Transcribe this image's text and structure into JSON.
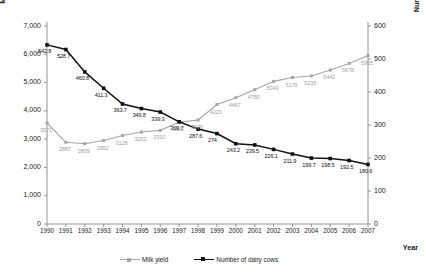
{
  "chart_data": {
    "type": "line",
    "title": "",
    "xlabel": "Year",
    "ylabel": "Milk (kg milk/milking cow/year)",
    "ylabel_right": "Number of dairy cows (ths.heads)",
    "categories": [
      "1990",
      "1991",
      "1992",
      "1993",
      "1994",
      "1995",
      "1996",
      "1997",
      "1998",
      "1999",
      "2000",
      "2001",
      "2002",
      "2003",
      "2004",
      "2005",
      "2006",
      "2007"
    ],
    "ylim": [
      0,
      7000
    ],
    "ylim_right": [
      0,
      600
    ],
    "yticks": [
      "0",
      "1,000",
      "2,000",
      "3,000",
      "4,000",
      "5,000",
      "6,000",
      "7,000"
    ],
    "yticks_right": [
      "0",
      "100",
      "200",
      "300",
      "400",
      "500",
      "600"
    ],
    "grid": false,
    "legend_position": "bottom",
    "series": [
      {
        "name": "Milk yield",
        "axis": "left",
        "color": "#a6a6a6",
        "values": [
          3571,
          2887,
          2839,
          2952,
          3128,
          3252,
          3310,
          3602,
          3676,
          4223,
          4467,
          4750,
          5043,
          5179,
          5235,
          5442,
          5678,
          5955
        ],
        "labels": [
          "3571",
          "2887",
          "2839",
          "2952",
          "3128",
          "3252",
          "3310",
          "3602",
          "3676",
          "4223",
          "4467",
          "4750",
          "5043",
          "5179",
          "5235",
          "5442",
          "5678",
          "5955"
        ]
      },
      {
        "name": "Number of dairy cows",
        "axis": "right",
        "color": "#111111",
        "values": [
          542.8,
          528.7,
          460.8,
          411.3,
          363.7,
          349.8,
          339.3,
          309.7,
          287.6,
          274,
          243.2,
          239.5,
          226.1,
          211.9,
          199.7,
          198.5,
          192.5,
          180.6
        ],
        "labels": [
          "542.8",
          "528.7",
          "460.8",
          "411.3",
          "363.7",
          "349.8",
          "339.3",
          "309.7",
          "287.6",
          "274",
          "243.2",
          "239.5",
          "226.1",
          "211.9",
          "199.7",
          "198.5",
          "192.5",
          "180.6"
        ]
      }
    ]
  },
  "legend": {
    "yield_label": "Milk yield",
    "cows_label": "Number of dairy cows"
  }
}
